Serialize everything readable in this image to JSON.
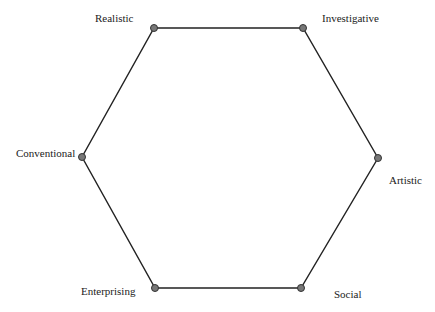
{
  "diagram": {
    "type": "hexagon",
    "edge_color": "#222222",
    "node_fill": "#777777",
    "node_stroke": "#333333",
    "nodes": [
      {
        "label": "Realistic",
        "x": 154,
        "y": 28,
        "lx": 95,
        "ly": 22
      },
      {
        "label": "Investigative",
        "x": 303,
        "y": 28,
        "lx": 322,
        "ly": 22
      },
      {
        "label": "Artistic",
        "x": 378,
        "y": 158,
        "lx": 389,
        "ly": 184
      },
      {
        "label": "Social",
        "x": 301,
        "y": 288,
        "lx": 334,
        "ly": 298
      },
      {
        "label": "Enterprising",
        "x": 155,
        "y": 288,
        "lx": 81,
        "ly": 295
      },
      {
        "label": "Conventional",
        "x": 82,
        "y": 157,
        "lx": 16,
        "ly": 157
      }
    ]
  }
}
